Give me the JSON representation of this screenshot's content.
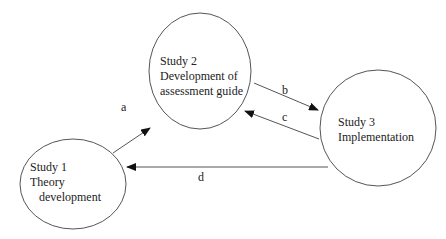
{
  "colors": {
    "stroke": "#555555",
    "arrow": "#111111",
    "text": "#222222",
    "background": "#ffffff"
  },
  "nodes": [
    {
      "id": "study1",
      "lines": [
        "Study 1",
        "Theory",
        "development"
      ]
    },
    {
      "id": "study2",
      "lines": [
        "Study 2",
        "Development of",
        "assessment guide"
      ]
    },
    {
      "id": "study3",
      "lines": [
        "Study 3",
        "Implementation"
      ]
    }
  ],
  "edges": [
    {
      "id": "a",
      "label": "a",
      "from": "Study 1",
      "to": "Study 2"
    },
    {
      "id": "b",
      "label": "b",
      "from": "Study 2",
      "to": "Study 3"
    },
    {
      "id": "c",
      "label": "c",
      "from": "Study 3",
      "to": "Study 2"
    },
    {
      "id": "d",
      "label": "d",
      "from": "Study 3",
      "to": "Study 1"
    }
  ]
}
